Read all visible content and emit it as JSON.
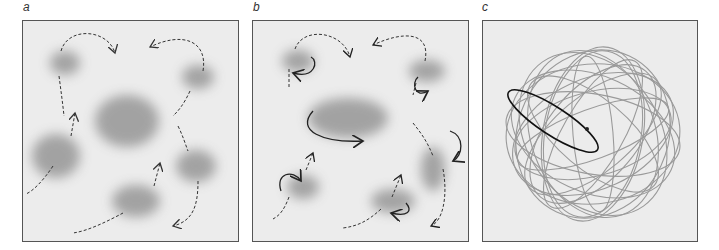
{
  "figure": {
    "panels": [
      {
        "id": "a",
        "label": "a",
        "description": "Blurred gray regions (blobs) connected by dashed arrows indicating transitions"
      },
      {
        "id": "b",
        "label": "b",
        "description": "Blurred gray regions with dashed transition arrows and solid curved arrows indicating local rotation"
      },
      {
        "id": "c",
        "label": "c",
        "description": "Overlapping gray elliptical orbits forming a sphere-like shape, one highlighted black ellipse with a dot at its focus"
      }
    ]
  },
  "colors": {
    "panel_bg": "#ececec",
    "border": "#555555",
    "blob": "#8a8a8a",
    "arrow": "#333333",
    "orbit": "#8c8c8c",
    "highlight": "#111111"
  }
}
